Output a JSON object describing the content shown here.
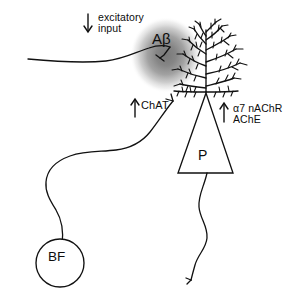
{
  "figure": {
    "background_color": "#ffffff",
    "ink_color": "#111111",
    "plaque_color": "#8a8a8a"
  },
  "labels": {
    "excitatory_input": "excitatory\ninput",
    "amyloid_beta": "Aβ",
    "chat": "ChAT",
    "receptor_line1": "α7 nAChR",
    "receptor_line2": "AChE",
    "pyramidal": "P",
    "basal_forebrain": "BF"
  },
  "arrows": {
    "excitatory_direction": "down",
    "chat_direction": "up",
    "receptor_direction": "up"
  },
  "elements": {
    "plaque": "amyloid-beta-plaque",
    "pyramidal_soma": "pyramidal-neuron-soma",
    "apical_dendrite": "apical-dendritic-tree",
    "descending_axon": "pyramidal-axon",
    "afferent_axon": "excitatory-afferent-axon",
    "cholinergic_axon": "cholinergic-projection-axon",
    "basal_forebrain_soma": "basal-forebrain-neuron-soma"
  }
}
